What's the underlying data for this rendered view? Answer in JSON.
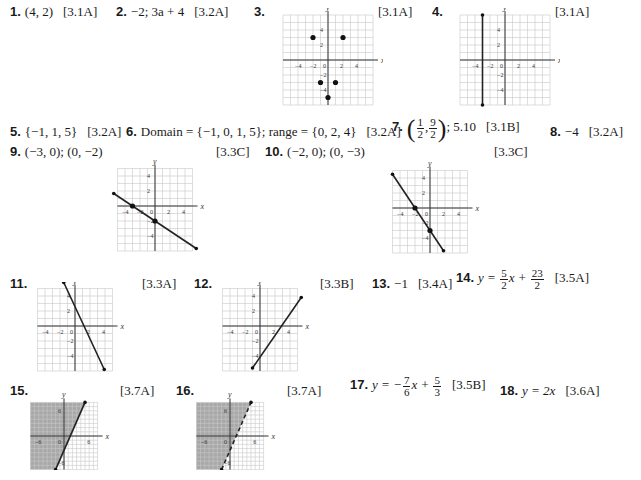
{
  "answers": [
    {
      "n": "1.",
      "text": "(4, 2)",
      "section": "[3.1A]"
    },
    {
      "n": "2.",
      "text": "−2; 3a + 4",
      "section": "[3.2A]"
    },
    {
      "n": "3.",
      "section": "[3.1A]"
    },
    {
      "n": "4.",
      "section": "[3.1A]"
    },
    {
      "n": "5.",
      "text": "{−1, 1, 5}",
      "section": "[3.2A]"
    },
    {
      "n": "6.",
      "text": "Domain = {−1, 0, 1, 5}; range = {0, 2, 4}",
      "section": "[3.2A]"
    },
    {
      "n": "7.",
      "frac1": {
        "num": "1",
        "den": "2"
      },
      "frac2": {
        "num": "9",
        "den": "2"
      },
      "text": "; 5.10",
      "section": "[3.1B]"
    },
    {
      "n": "8.",
      "text": "−4",
      "section": "[3.2A]"
    },
    {
      "n": "9.",
      "text": "(−3, 0); (0, −2)",
      "section": "[3.3C]"
    },
    {
      "n": "10.",
      "text": "(−2, 0); (0, −3)",
      "section": "[3.3C]"
    },
    {
      "n": "11.",
      "section": "[3.3A]"
    },
    {
      "n": "12.",
      "section": "[3.3B]"
    },
    {
      "n": "13.",
      "text": "−1",
      "section": "[3.4A]"
    },
    {
      "n": "14.",
      "prefix": "y = ",
      "frac1": {
        "num": "5",
        "den": "2"
      },
      "mid": "x + ",
      "frac2": {
        "num": "23",
        "den": "2"
      },
      "section": "[3.5A]"
    },
    {
      "n": "15.",
      "section": "[3.7A]"
    },
    {
      "n": "16.",
      "section": "[3.7A]"
    },
    {
      "n": "17.",
      "prefix": "y = −",
      "frac1": {
        "num": "7",
        "den": "6"
      },
      "mid": "x + ",
      "frac2": {
        "num": "5",
        "den": "3"
      },
      "section": "[3.5B]"
    },
    {
      "n": "18.",
      "text": "y = 2x",
      "section": "[3.6A]"
    }
  ],
  "graph_labels": {
    "x": "x",
    "y": "y"
  },
  "graphs": {
    "g3": {
      "ticks": [
        "−4",
        "−2",
        "0",
        "2",
        "4",
        "4",
        "2",
        "−2",
        "−4"
      ],
      "points": [
        [
          -2,
          3
        ],
        [
          2,
          3
        ],
        [
          -1,
          -3
        ],
        [
          1,
          -3
        ],
        [
          0,
          -5
        ]
      ]
    },
    "g4": {
      "ticks": [
        "−4",
        "−2",
        "0",
        "2",
        "4",
        "4",
        "2",
        "−2",
        "−4"
      ],
      "line": "x = -3"
    },
    "g9": {
      "ticks": [
        "−4",
        "−2",
        "0",
        "2",
        "4",
        "4",
        "2",
        "−2",
        "−4"
      ],
      "points": [
        [
          -3,
          0
        ],
        [
          0,
          -2
        ]
      ]
    },
    "g10": {
      "ticks": [
        "−4",
        "−2",
        "0",
        "2",
        "4",
        "4",
        "2",
        "−2",
        "−4"
      ],
      "points": [
        [
          -2,
          0
        ],
        [
          0,
          -3
        ]
      ]
    },
    "g11": {
      "ticks": [
        "−4",
        "−2",
        "0",
        "2",
        "4",
        "4",
        "2",
        "−2",
        "−4"
      ]
    },
    "g12": {
      "ticks": [
        "−4",
        "−2",
        "0",
        "2",
        "4",
        "4",
        "2",
        "−2",
        "−4"
      ]
    },
    "g15": {
      "ticks": [
        "−6",
        "0",
        "6",
        "6",
        "−6"
      ],
      "boundary": "solid"
    },
    "g16": {
      "ticks": [
        "−6",
        "0",
        "6",
        "6",
        "−6"
      ],
      "boundary": "dashed"
    }
  }
}
